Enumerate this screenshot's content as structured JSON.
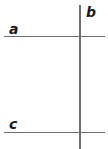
{
  "figure": {
    "title": "",
    "type": "geometry-line-diagram",
    "background_color": "#ffffff",
    "line_color": "#6e6e6e",
    "label_color": "#1a1a1a",
    "width": 108,
    "height": 149
  },
  "lines": [
    {
      "id": "a",
      "label": "a",
      "orientation": "horizontal",
      "x1": 4,
      "y1": 36,
      "x2": 105,
      "y2": 36
    },
    {
      "id": "b",
      "label": "b",
      "orientation": "vertical",
      "x1": 80,
      "y1": 5,
      "x2": 80,
      "y2": 149
    },
    {
      "id": "c",
      "label": "c",
      "orientation": "horizontal",
      "x1": 4,
      "y1": 132,
      "x2": 105,
      "y2": 132
    }
  ],
  "labels": {
    "a": "a",
    "b": "b",
    "c": "c"
  }
}
